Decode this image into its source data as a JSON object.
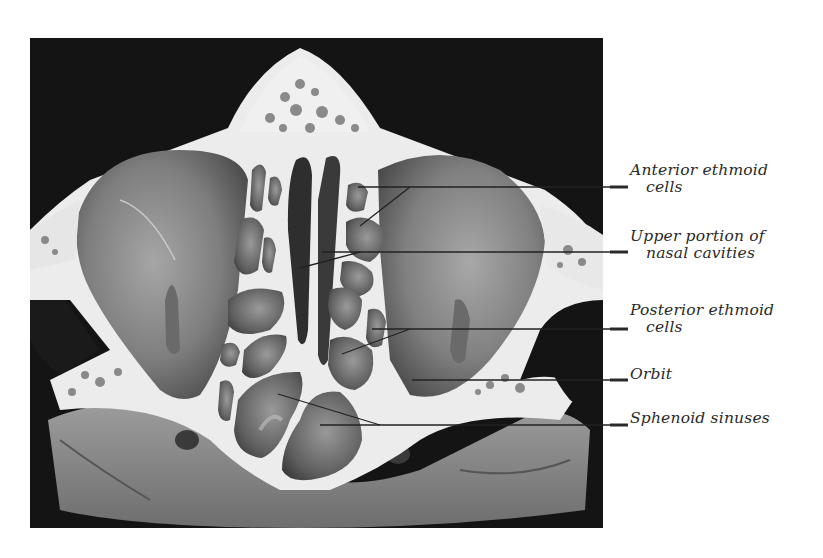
{
  "figure": {
    "type": "anatomical-illustration",
    "colors": {
      "background": "#111111",
      "bone": "#ececec",
      "tissue_dark": "#5a5a5a",
      "tissue_mid": "#8c8c8c",
      "leader_line": "#222222"
    }
  },
  "labels": [
    {
      "id": "anterior-ethmoid",
      "line1": "Anterior ethmoid",
      "line2": "cells"
    },
    {
      "id": "upper-nasal",
      "line1": "Upper portion of",
      "line2": "nasal cavities"
    },
    {
      "id": "posterior-ethmoid",
      "line1": "Posterior ethmoid",
      "line2": "cells"
    },
    {
      "id": "orbit",
      "line1": "Orbit",
      "line2": ""
    },
    {
      "id": "sphenoid",
      "line1": "Sphenoid sinuses",
      "line2": ""
    }
  ]
}
